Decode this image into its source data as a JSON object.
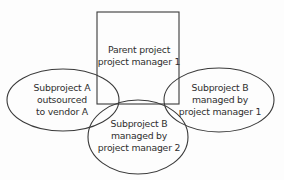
{
  "diagram": {
    "nodes": [
      {
        "id": "parent",
        "shape": "rectangle",
        "lines": [
          "Parent project",
          "project manager 1"
        ]
      },
      {
        "id": "subproject-a",
        "shape": "ellipse",
        "lines": [
          "Subproject A",
          "outsourced",
          "to vendor A"
        ]
      },
      {
        "id": "subproject-b-pm2",
        "shape": "ellipse",
        "lines": [
          "Subproject B",
          "managed by",
          "project manager 2"
        ]
      },
      {
        "id": "subproject-b-pm1",
        "shape": "ellipse",
        "lines": [
          "Subproject B",
          "managed by",
          "project manager 1"
        ]
      }
    ],
    "colors": {
      "stroke": "#3a3a3a",
      "text": "#2e2e2e",
      "background": "#fdfdfd"
    }
  }
}
